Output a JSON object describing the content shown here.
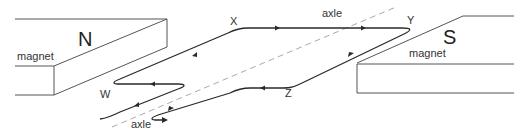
{
  "diagram": {
    "title": "",
    "labels": {
      "north_pole": "N",
      "south_pole": "S",
      "magnet_left": "magnet",
      "magnet_right": "magnet",
      "axle_top": "axle",
      "axle_bottom": "axle",
      "corner_w": "W",
      "corner_x": "X",
      "corner_y": "Y",
      "corner_z": "Z"
    },
    "components": [
      {
        "id": "north-magnet",
        "label": "magnet",
        "pole": "N"
      },
      {
        "id": "south-magnet",
        "label": "magnet",
        "pole": "S"
      },
      {
        "id": "coil",
        "corners": [
          "W",
          "X",
          "Y",
          "Z"
        ]
      },
      {
        "id": "axle",
        "style": "dashed"
      }
    ],
    "current_direction": "W → X → Y → Z → W (arrows along coil)",
    "colors": {
      "wire": "#2a2a2a",
      "magnet_edge": "#555555",
      "axle": "#aaaaaa",
      "text": "#333333"
    }
  }
}
